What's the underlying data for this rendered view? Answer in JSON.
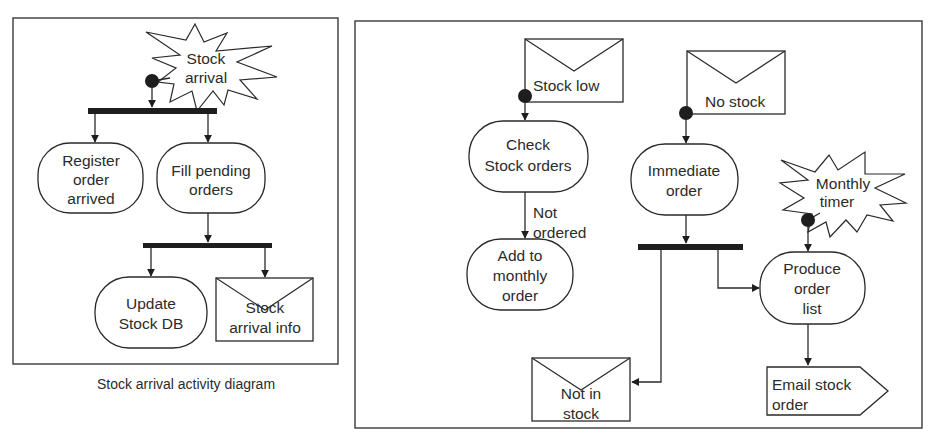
{
  "colors": {
    "ink": "#2a2a2a",
    "fill": "#1e1e1e",
    "background": "#ffffff"
  },
  "left_diagram": {
    "caption": "Stock arrival activity diagram",
    "event": {
      "line1": "Stock",
      "line2": "arrival"
    },
    "activities": {
      "register": {
        "line1": "Register",
        "line2": "order",
        "line3": "arrived"
      },
      "fill_pending": {
        "line1": "Fill pending",
        "line2": "orders"
      },
      "update_db": {
        "line1": "Update",
        "line2": "Stock DB"
      }
    },
    "signal": {
      "line1": "Stock",
      "line2": "arrival info"
    }
  },
  "right_diagram": {
    "signals_in": {
      "stock_low": {
        "label": "Stock low"
      },
      "no_stock": {
        "label": "No stock"
      }
    },
    "event": {
      "line1": "Monthly",
      "line2": "timer"
    },
    "activities": {
      "check_orders": {
        "line1": "Check",
        "line2": "Stock orders"
      },
      "add_monthly": {
        "line1": "Add to",
        "line2": "monthly",
        "line3": "order"
      },
      "immediate": {
        "line1": "Immediate",
        "line2": "order"
      },
      "produce_list": {
        "line1": "Produce",
        "line2": "order",
        "line3": "list"
      }
    },
    "guard": {
      "line1": "Not",
      "line2": "ordered"
    },
    "signal_out": {
      "line1": "Not in",
      "line2": "stock"
    },
    "send_signal": {
      "line1": "Email stock",
      "line2": "order"
    }
  }
}
